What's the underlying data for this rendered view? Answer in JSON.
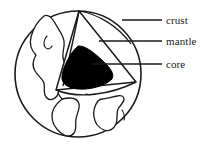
{
  "figure": {
    "name": "earth-cutaway-diagram",
    "background_color": "#ffffff",
    "line_color": "#1a1a1a",
    "core_fill": "#000000",
    "mantle_fill": "#ffffff",
    "crust_fill": "#ffffff"
  },
  "labels": {
    "crust": "crust",
    "mantle": "mantle",
    "core": "core"
  },
  "leaders": [
    {
      "id": "crust-leader",
      "from_x": 122,
      "from_y": 20,
      "to_x": 162,
      "to_y": 20
    },
    {
      "id": "mantle-leader",
      "from_x": 99,
      "from_y": 41,
      "to_x": 162,
      "to_y": 41
    },
    {
      "id": "core-leader",
      "from_x": 92,
      "from_y": 64,
      "to_x": 162,
      "to_y": 64
    }
  ],
  "globe": {
    "center_x": 78,
    "center_y": 74,
    "radius": 63
  }
}
